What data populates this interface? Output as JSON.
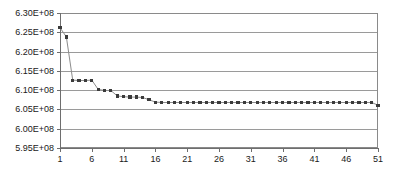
{
  "chart_data": {
    "type": "line",
    "title": "",
    "subtitle": "",
    "xlabel": "",
    "ylabel": "",
    "legend": [],
    "legend_position": "none",
    "grid": true,
    "grid_axis": "y",
    "xlim": [
      1,
      51
    ],
    "ylim": [
      595000000,
      630000000
    ],
    "yticks": [
      595000000,
      600000000,
      605000000,
      610000000,
      615000000,
      620000000,
      625000000,
      630000000
    ],
    "ytick_labels": [
      "5.95E+08",
      "6.00E+08",
      "6.05E+08",
      "6.10E+08",
      "6.15E+08",
      "6.20E+08",
      "6.25E+08",
      "6.30E+08"
    ],
    "xticks": [
      1,
      6,
      11,
      16,
      21,
      26,
      31,
      36,
      41,
      46,
      51
    ],
    "xtick_labels": [
      "1",
      "6",
      "11",
      "16",
      "21",
      "26",
      "31",
      "36",
      "41",
      "46",
      "51"
    ],
    "marker": "square",
    "marker_color": "#3b3b3b",
    "line_color": "#8c8c8c",
    "series": [
      {
        "name": "objective",
        "x": [
          1,
          2,
          3,
          4,
          5,
          6,
          7,
          8,
          9,
          10,
          11,
          12,
          13,
          14,
          15,
          16,
          17,
          18,
          19,
          20,
          21,
          22,
          23,
          24,
          25,
          26,
          27,
          28,
          29,
          30,
          31,
          32,
          33,
          34,
          35,
          36,
          37,
          38,
          39,
          40,
          41,
          42,
          43,
          44,
          45,
          46,
          47,
          48,
          49,
          50,
          51
        ],
        "values": [
          626200000,
          623800000,
          612600000,
          612500000,
          612500000,
          612600000,
          610200000,
          609900000,
          609900000,
          608500000,
          608300000,
          608200000,
          608200000,
          608100000,
          607500000,
          606900000,
          606800000,
          606800000,
          606800000,
          606800000,
          606800000,
          606800000,
          606800000,
          606800000,
          606800000,
          606800000,
          606800000,
          606800000,
          606800000,
          606800000,
          606800000,
          606800000,
          606800000,
          606800000,
          606800000,
          606800000,
          606800000,
          606800000,
          606800000,
          606800000,
          606800000,
          606800000,
          606800000,
          606800000,
          606800000,
          606800000,
          606800000,
          606800000,
          606800000,
          606800000,
          606100000
        ]
      }
    ]
  },
  "plot_area": {
    "left": 60,
    "top": 13,
    "right": 378,
    "bottom": 148
  },
  "colors": {
    "axis": "#6e6e6e",
    "grid": "#9a9a9a",
    "text": "#1a1a1a",
    "plot_border": "#8a8a8a",
    "background": "#ffffff"
  }
}
